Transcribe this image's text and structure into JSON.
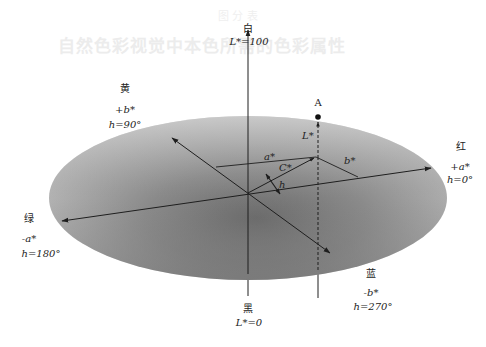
{
  "diagram": {
    "type": "CIELAB color space diagram",
    "colors": {
      "ellipse_light": "#c4c4c4",
      "ellipse_dark": "#6e6e6e",
      "line": "#1e1e1e",
      "background": "#ffffff",
      "bleed_text": "#ececec"
    },
    "bleed_through": {
      "top_line": "图 分 表",
      "heading": "自然色彩视觉中本色所需的色彩属性"
    },
    "poles": {
      "white": {
        "name": "白",
        "value": "L*=100"
      },
      "black": {
        "name": "黑",
        "value": "L*=0"
      }
    },
    "hue_directions": {
      "yellow": {
        "name": "黄",
        "axis": "+b*",
        "angle": "h=90°"
      },
      "red": {
        "name": "红",
        "axis": "+a*",
        "angle": "h=0°"
      },
      "green": {
        "name": "绿",
        "axis": "-a*",
        "angle": "h=180°"
      },
      "blue": {
        "name": "蓝",
        "axis": "-b*",
        "angle": "h=270°"
      }
    },
    "point": {
      "label": "A"
    },
    "components": {
      "lightness": "L*",
      "a": "a*",
      "b": "b*",
      "chroma": "C*",
      "hue": "h"
    }
  }
}
